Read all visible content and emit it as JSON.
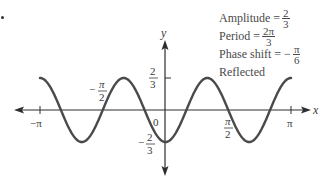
{
  "chart_data": {
    "type": "line",
    "title": "",
    "function": "y = -(2/3) cos(3x + π/2 - π/2) = -(2/3) sin(3(x + π/6))",
    "xlabel": "x",
    "ylabel": "y",
    "xlim": [
      -3.14159,
      3.14159
    ],
    "ylim": [
      -0.6667,
      0.6667
    ],
    "grid": false,
    "x_ticks": [
      {
        "value": -3.14159,
        "label": "−π"
      },
      {
        "value": -1.5708,
        "label_num": "π",
        "label_den": "2",
        "label_sign": "−"
      },
      {
        "value": 0,
        "label": "0"
      },
      {
        "value": 1.5708,
        "label_num": "π",
        "label_den": "2",
        "label_sign": ""
      },
      {
        "value": 3.14159,
        "label": "π"
      }
    ],
    "y_ticks": [
      {
        "value": 0.6667,
        "label_num": "2",
        "label_den": "3",
        "label_sign": ""
      },
      {
        "value": -0.6667,
        "label_num": "2",
        "label_den": "3",
        "label_sign": "−"
      }
    ],
    "series": [
      {
        "name": "y = -(2/3)cos(3x)",
        "amplitude": 0.6667,
        "period": 2.0944,
        "phase_shift": -0.5236,
        "reflected": true,
        "key_points": [
          {
            "x": -3.14159,
            "y": 0.6667
          },
          {
            "x": -2.0944,
            "y": -0.6667
          },
          {
            "x": -1.0472,
            "y": 0.6667
          },
          {
            "x": 0,
            "y": -0.6667
          },
          {
            "x": 1.0472,
            "y": 0.6667
          },
          {
            "x": 2.0944,
            "y": -0.6667
          },
          {
            "x": 3.14159,
            "y": 0.6667
          }
        ]
      }
    ],
    "annotations": [
      {
        "text": "Amplitude = ",
        "frac_num": "2",
        "frac_den": "3",
        "sign": ""
      },
      {
        "text": "Period = ",
        "frac_num": "2π",
        "frac_den": "3",
        "sign": ""
      },
      {
        "text": "Phase shift = ",
        "frac_num": "π",
        "frac_den": "6",
        "sign": "−"
      },
      {
        "text": "Reflected"
      }
    ]
  },
  "labels": {
    "x_axis": "x",
    "y_axis": "y",
    "neg_pi": "−π",
    "pi": "π",
    "zero": "0",
    "neg_half_pi_sign": "−",
    "half_pi_num": "π",
    "half_pi_den": "2",
    "two": "2",
    "three": "3",
    "neg_sign": "−"
  },
  "annotation": {
    "amplitude_label": "Amplitude =",
    "amplitude_num": "2",
    "amplitude_den": "3",
    "period_label": "Period =",
    "period_num": "2π",
    "period_den": "3",
    "phase_label": "Phase shift = −",
    "phase_num": "π",
    "phase_den": "6",
    "reflected_label": "Reflected"
  },
  "colors": {
    "curve": "#4a4a4a",
    "axis": "#2e2e2e"
  }
}
